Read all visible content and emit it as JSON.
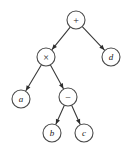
{
  "figure": {
    "background_color": "#ffffff",
    "stroke_color": "#4a4a4a",
    "edge_color": "#3a3a3a",
    "label_color": "#1a1a1a",
    "node_radius": 9
  },
  "nodes": [
    {
      "id": "root",
      "label": "+",
      "kind": "operator",
      "cx": 76,
      "cy": 20
    },
    {
      "id": "times",
      "label": "×",
      "kind": "operator",
      "cx": 46,
      "cy": 57
    },
    {
      "id": "d",
      "label": "d",
      "kind": "operand",
      "cx": 111,
      "cy": 57
    },
    {
      "id": "a",
      "label": "a",
      "kind": "operand",
      "cx": 21,
      "cy": 99
    },
    {
      "id": "minus",
      "label": "−",
      "kind": "operator",
      "cx": 68,
      "cy": 97
    },
    {
      "id": "b",
      "label": "b",
      "kind": "operand",
      "cx": 52,
      "cy": 133
    },
    {
      "id": "c",
      "label": "c",
      "kind": "operand",
      "cx": 84,
      "cy": 133
    }
  ],
  "edges": [
    {
      "id": "root-times",
      "from": "root",
      "to": "times",
      "arrow": true
    },
    {
      "id": "root-d",
      "from": "root",
      "to": "d",
      "arrow": true
    },
    {
      "id": "times-a",
      "from": "times",
      "to": "a",
      "arrow": true
    },
    {
      "id": "times-minus",
      "from": "times",
      "to": "minus",
      "arrow": true
    },
    {
      "id": "minus-b",
      "from": "minus",
      "to": "b",
      "arrow": true
    },
    {
      "id": "minus-c",
      "from": "minus",
      "to": "c",
      "arrow": true
    }
  ]
}
